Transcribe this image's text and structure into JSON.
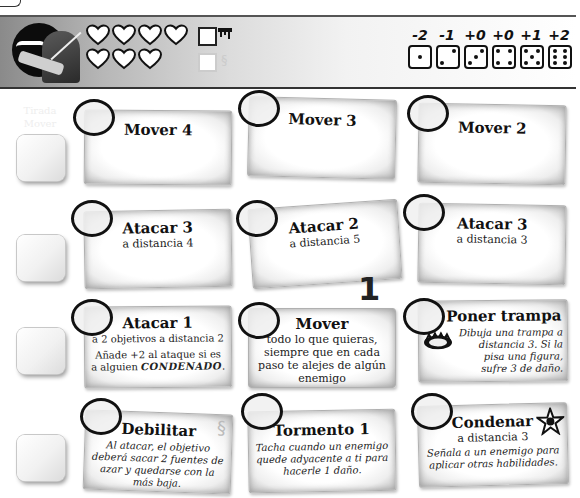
{
  "header": {
    "portrait": "hooded-knife-character-portrait",
    "hearts_row1": 4,
    "hearts_row2": 3,
    "status_icons": [
      {
        "name": "dripping-blood-icon",
        "glyph": "▀",
        "state": "active"
      },
      {
        "name": "chain-link-icon",
        "glyph": "∞",
        "state": "faded"
      }
    ]
  },
  "dice": {
    "modifiers": [
      "-2",
      "-1",
      "+0",
      "+0",
      "+1",
      "+2"
    ],
    "faces": [
      1,
      2,
      3,
      4,
      5,
      6
    ]
  },
  "level_marker": "1",
  "rows": [
    {
      "faint_label": "Tirada Mover",
      "cards": [
        {
          "title": "Mover 4",
          "sub": "",
          "desc": ""
        },
        {
          "title": "Mover 3",
          "sub": "",
          "desc": ""
        },
        {
          "title": "Mover 2",
          "sub": "",
          "desc": ""
        }
      ]
    },
    {
      "faint_label": "",
      "cards": [
        {
          "title": "Atacar 3",
          "sub": "a distancia 4",
          "desc": ""
        },
        {
          "title": "Atacar 2",
          "sub": "a distancia 5",
          "desc": ""
        },
        {
          "title": "Atacar 3",
          "sub": "a distancia 3",
          "desc": ""
        }
      ]
    },
    {
      "faint_label": "",
      "cards": [
        {
          "title": "Atacar 1",
          "sub": "a 2 objetivos a distancia 2",
          "desc_a": "Añade +2 al ataque si es",
          "desc_b": "a alguien",
          "desc_keyword": "CONDENADO",
          "desc_end": "."
        },
        {
          "title": "Mover",
          "sub": "todo lo que quieras, siempre que en cada paso te alejes de algún enemigo",
          "desc": ""
        },
        {
          "title": "Poner trampa",
          "sub": "",
          "desc": "Dibuja una trampa a distancia 3. Si la pisa una figura, sufre 3 de daño.",
          "icon": "bear-trap-icon"
        }
      ]
    },
    {
      "faint_label": "",
      "cards": [
        {
          "title": "Debilitar",
          "sub": "",
          "desc": "Al atacar, el objetivo deberá sacar 2 fuentes de azar y quedarse con la más baja.",
          "icon": "chain-link-icon"
        },
        {
          "title": "Tormento 1",
          "sub": "",
          "desc": "Tacha cuando un enemigo quede adyacente a ti para hacerle 1 daño."
        },
        {
          "title": "Condenar",
          "sub": "a distancia 3",
          "desc": "Señala a un enemigo para aplicar otras habilidades.",
          "icon": "curse-star-icon"
        }
      ]
    }
  ]
}
